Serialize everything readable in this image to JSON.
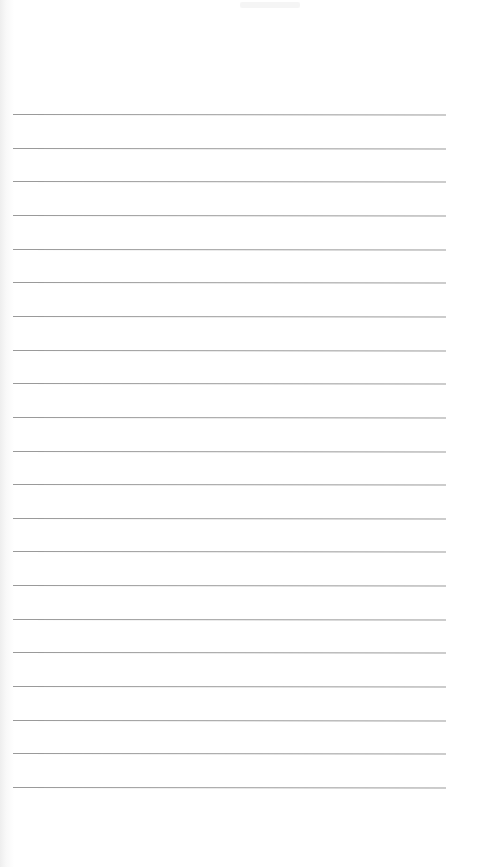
{
  "document": {
    "type": "lined-paper",
    "background_color": "#ffffff",
    "line_color": "#9a9a9a",
    "line_count": 21,
    "first_line_y": 114,
    "line_spacing": 33.65,
    "line_left": 13,
    "line_right": 446
  }
}
